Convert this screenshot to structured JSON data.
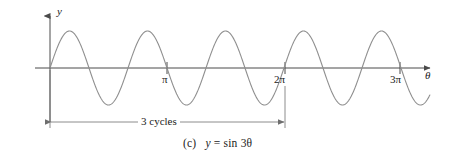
{
  "figure": {
    "caption_marker": "(c)",
    "caption_equation_lhs": "y",
    "caption_equation_eq": "=",
    "caption_equation_rhs": "sin 3θ",
    "caption_full": "(c)   y = sin 3θ",
    "background_color": "#ffffff",
    "curve_color": "#8f8f8f",
    "axis_color": "#4a4a4a",
    "dimension_color": "#6e6e6e",
    "text_color": "#222222"
  },
  "axes": {
    "y_axis_label": "y",
    "x_axis_label": "θ",
    "x_ticks": [
      {
        "label": "π",
        "value": 3.14159,
        "px": 167
      },
      {
        "label": "2π",
        "value": 6.28319,
        "px": 285
      },
      {
        "label": "3π",
        "value": 9.42478,
        "px": 400
      }
    ],
    "origin_px": 50,
    "baseline_px": 68
  },
  "annotation": {
    "dimension_label": "3 cycles",
    "dimension_start_tick": "0",
    "dimension_end_tick": "2π"
  },
  "chart_data": {
    "type": "line",
    "xlabel": "θ",
    "ylabel": "y",
    "function": "y = sin 3θ",
    "amplitude": 1,
    "period": 2.0944,
    "frequency_multiplier": 3,
    "cycles_shown_to_2pi": 3,
    "xlim": [
      0,
      10.2
    ],
    "ylim": [
      -1.15,
      1.15
    ],
    "grid": false,
    "legend": null,
    "xtick_labels": [
      "π",
      "2π",
      "3π"
    ],
    "xtick_values": [
      3.14159,
      6.28319,
      9.42478
    ],
    "annotations": [
      {
        "text": "3 cycles",
        "x_start": 0,
        "x_end": 6.28319,
        "y": -1.45,
        "kind": "dimension-line"
      }
    ],
    "series": [
      {
        "name": "y = sin 3θ",
        "x": [
          0,
          0.175,
          0.349,
          0.524,
          0.698,
          0.873,
          1.047,
          1.222,
          1.396,
          1.571,
          1.745,
          1.92,
          2.094,
          2.269,
          2.443,
          2.618,
          2.793,
          2.967,
          3.142,
          3.316,
          3.491,
          3.665,
          3.84,
          4.014,
          4.189,
          4.363,
          4.538,
          4.712,
          4.887,
          5.061,
          5.236,
          5.411,
          5.585,
          5.76,
          5.934,
          6.109,
          6.283,
          6.458,
          6.632,
          6.807,
          6.981,
          7.156,
          7.33,
          7.505,
          7.679,
          7.854,
          8.029,
          8.203,
          8.378,
          8.552,
          8.727,
          8.901,
          9.076,
          9.25,
          9.425,
          9.599,
          9.774,
          9.948,
          10.123
        ],
        "y": [
          0,
          0.5,
          0.866,
          1,
          0.866,
          0.5,
          0,
          -0.5,
          -0.866,
          -1,
          -0.866,
          -0.5,
          0,
          0.5,
          0.866,
          1,
          0.866,
          0.5,
          0,
          -0.5,
          -0.866,
          -1,
          -0.866,
          -0.5,
          0,
          0.5,
          0.866,
          1,
          0.866,
          0.5,
          0,
          -0.5,
          -0.866,
          -1,
          -0.866,
          -0.5,
          0,
          0.5,
          0.866,
          1,
          0.866,
          0.5,
          0,
          -0.5,
          -0.866,
          -1,
          -0.866,
          -0.5,
          0,
          0.5,
          0.866,
          1,
          0.866,
          0.5,
          0,
          -0.5,
          -0.866,
          -1,
          -0.866
        ]
      }
    ]
  }
}
